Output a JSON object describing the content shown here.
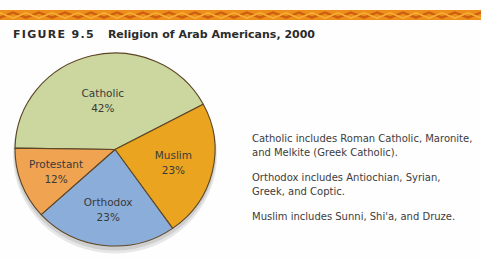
{
  "banner": {
    "base_color": "#ee8e1a",
    "zigzag_dark_color": "#cd5f10",
    "zigzag_light_color": "#f6ad36"
  },
  "figure": {
    "label": "FIGURE 9.5",
    "title": "Religion of Arab Americans, 2000"
  },
  "chart_data": {
    "type": "pie",
    "title": "Religion of Arab Americans, 2000",
    "slices": [
      {
        "label": "Catholic",
        "value": 42,
        "color": "#cbd79f",
        "label_radius": 0.52
      },
      {
        "label": "Muslim",
        "value": 23,
        "color": "#eaa41f",
        "label_radius": 0.6
      },
      {
        "label": "Orthodox",
        "value": 23,
        "color": "#8badd9",
        "label_radius": 0.63
      },
      {
        "label": "Protestant",
        "value": 12,
        "color": "#f0a351",
        "label_radius": 0.63
      }
    ],
    "value_suffix": "%",
    "start_angle_deg_clockwise_from_top": 270.8,
    "stroke_color": "#5c4626",
    "label_color": "#3a3a3a",
    "shadow_color": "#cccccc",
    "legend": "none",
    "labels_inside_slices": true
  },
  "notes": [
    "Catholic includes Roman Catholic, Maronite, and Melkite (Greek Catholic).",
    "Orthodox includes Antiochian, Syrian, Greek, and Coptic.",
    "Muslim includes Sunni, Shi'a, and Druze."
  ]
}
